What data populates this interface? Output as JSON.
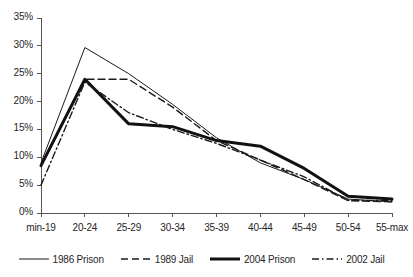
{
  "chart_data": {
    "type": "line",
    "title": "",
    "xlabel": "",
    "ylabel": "",
    "ylim": [
      0,
      35
    ],
    "yticks": [
      0,
      5,
      10,
      15,
      20,
      25,
      30,
      35
    ],
    "ytick_labels": [
      "0%",
      "5%",
      "10%",
      "15%",
      "20%",
      "25%",
      "30%",
      "35%"
    ],
    "grid": false,
    "legend_position": "bottom",
    "categories": [
      "min-19",
      "20-24",
      "25-29",
      "30-34",
      "35-39",
      "40-44",
      "45-49",
      "50-54",
      "55-max"
    ],
    "series": [
      {
        "name": "1986 Prison",
        "style": "solid-thin",
        "color": "#1a1a1a",
        "width": 1,
        "dash": "none",
        "values": [
          9.0,
          29.7,
          25.0,
          19.5,
          13.5,
          9.0,
          6.0,
          2.5,
          2.0
        ]
      },
      {
        "name": "1989 Jail",
        "style": "dashed",
        "color": "#1a1a1a",
        "width": 1.4,
        "dash": "7,4",
        "values": [
          8.5,
          24.0,
          24.0,
          19.0,
          13.0,
          9.5,
          6.0,
          2.2,
          2.0
        ]
      },
      {
        "name": "2004 Prison",
        "style": "solid-thick",
        "color": "#111111",
        "width": 3,
        "dash": "none",
        "values": [
          8.5,
          24.0,
          16.0,
          15.5,
          13.0,
          12.0,
          8.0,
          3.0,
          2.5
        ]
      },
      {
        "name": "2002 Jail",
        "style": "dash-dot",
        "color": "#1a1a1a",
        "width": 1.4,
        "dash": "7,3,1.5,3",
        "values": [
          5.0,
          23.5,
          18.0,
          15.0,
          12.5,
          9.5,
          6.5,
          2.3,
          2.2
        ]
      }
    ]
  },
  "legend": {
    "items": [
      {
        "label": "1986 Prison"
      },
      {
        "label": "1989 Jail"
      },
      {
        "label": "2004 Prison"
      },
      {
        "label": "2002 Jail"
      }
    ]
  },
  "axes": {
    "y_labels": [
      "35%",
      "30%",
      "25%",
      "20%",
      "15%",
      "10%",
      "5%",
      "0%"
    ],
    "x_labels": [
      "min-19",
      "20-24",
      "25-29",
      "30-34",
      "35-39",
      "40-44",
      "45-49",
      "50-54",
      "55-max"
    ]
  }
}
